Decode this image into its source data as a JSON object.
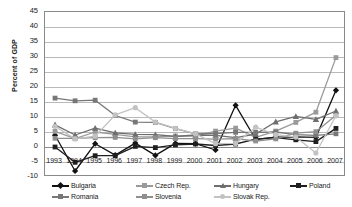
{
  "chart_data": {
    "type": "line",
    "title": "",
    "xlabel": "",
    "ylabel": "Percent of GDP",
    "categories": [
      "1993",
      "1994",
      "1995",
      "1996",
      "1997",
      "1998",
      "1999",
      "2000",
      "2001",
      "2002",
      "2003",
      "2004",
      "2005",
      "2006",
      "2007"
    ],
    "ylim": [
      -10,
      45
    ],
    "ystep": 5,
    "yticks": [
      "45",
      "40",
      "35",
      "30",
      "25",
      "20",
      "15",
      "10",
      "5",
      "0",
      "-5",
      "-10"
    ],
    "grid": true,
    "legend_position": "bottom",
    "series": [
      {
        "name": "Bulgaria",
        "color": "#111111",
        "marker": "diamond",
        "values": [
          3.9,
          -8.0,
          1.1,
          -2.7,
          1.3,
          -2.8,
          1.2,
          1.1,
          -1.0,
          13.9,
          2.5,
          3.3,
          3.4,
          3.2,
          18.9
        ]
      },
      {
        "name": "Czech Rep.",
        "color": "#9a9a9a",
        "marker": "square",
        "values": [
          5.2,
          2.8,
          5.0,
          4.2,
          3.4,
          3.4,
          3.7,
          3.6,
          5.3,
          6.3,
          3.2,
          5.3,
          8.2,
          11.6,
          29.8
        ]
      },
      {
        "name": "Hungary",
        "color": "#6e6e6e",
        "marker": "triangle",
        "values": [
          7.4,
          4.0,
          6.3,
          4.7,
          4.2,
          4.1,
          3.5,
          4.0,
          3.9,
          3.1,
          4.3,
          8.4,
          10.2,
          9.2,
          12.0
        ]
      },
      {
        "name": "Poland",
        "color": "#1f1f1f",
        "marker": "square",
        "values": [
          0.0,
          -5.1,
          -2.9,
          -2.9,
          0.2,
          -0.2,
          0.7,
          1.0,
          0.5,
          1.0,
          2.6,
          3.1,
          2.4,
          1.8,
          6.2
        ]
      },
      {
        "name": "Romania",
        "color": "#777777",
        "marker": "square",
        "values": [
          16.3,
          15.4,
          15.6,
          10.5,
          8.3,
          8.2,
          6.1,
          4.4,
          4.5,
          4.9,
          4.9,
          5.0,
          4.1,
          3.9,
          4.4
        ]
      },
      {
        "name": "Slovenia",
        "color": "#8f8f8f",
        "marker": "square",
        "values": [
          2.9,
          2.9,
          3.1,
          3.2,
          2.7,
          3.1,
          2.8,
          2.8,
          2.6,
          2.8,
          2.0,
          2.7,
          4.6,
          5.1,
          10.6
        ]
      },
      {
        "name": "Slovak Rep.",
        "color": "#c2c2c2",
        "marker": "circle",
        "values": [
          6.9,
          2.7,
          3.6,
          10.7,
          13.1,
          8.3,
          6.2,
          4.4,
          1.1,
          1.2,
          6.6,
          4.1,
          3.3,
          -2.0,
          10.4
        ]
      }
    ]
  },
  "axis": {
    "y_title": "Percent of GDP"
  }
}
